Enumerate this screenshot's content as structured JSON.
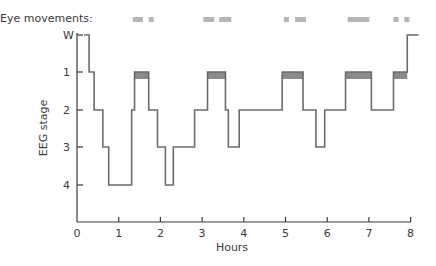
{
  "chart_data": {
    "type": "line",
    "subtype": "hypnogram (step)",
    "title": "",
    "xlabel": "Hours",
    "ylabel": "EEG stage",
    "xlim": [
      0,
      8
    ],
    "x_ticks": [
      "0",
      "1",
      "2",
      "3",
      "4",
      "5",
      "6",
      "7",
      "8"
    ],
    "y_ticks": [
      "W",
      "1",
      "2",
      "3",
      "4"
    ],
    "y_order_top_to_bottom": [
      "W",
      "1",
      "2",
      "3",
      "4"
    ],
    "grid": false,
    "legend": null,
    "eye_movements_label": "Eye movements:",
    "eye_movement_bars_hours": [
      [
        1.34,
        1.58
      ],
      [
        1.72,
        1.84
      ],
      [
        3.03,
        3.29
      ],
      [
        3.41,
        3.7
      ],
      [
        4.96,
        5.08
      ],
      [
        5.23,
        5.49
      ],
      [
        6.49,
        7.01
      ],
      [
        7.59,
        7.71
      ],
      [
        7.85,
        7.97
      ]
    ],
    "segments": [
      {
        "stage": "W",
        "start": 0.17,
        "end": 0.29,
        "rem": false
      },
      {
        "stage": "1",
        "start": 0.29,
        "end": 0.41,
        "rem": false
      },
      {
        "stage": "2",
        "start": 0.41,
        "end": 0.62,
        "rem": false
      },
      {
        "stage": "3",
        "start": 0.62,
        "end": 0.76,
        "rem": false
      },
      {
        "stage": "4",
        "start": 0.76,
        "end": 1.31,
        "rem": false
      },
      {
        "stage": "2",
        "start": 1.31,
        "end": 1.38,
        "rem": false
      },
      {
        "stage": "1",
        "start": 1.38,
        "end": 1.72,
        "rem": true
      },
      {
        "stage": "2",
        "start": 1.72,
        "end": 1.93,
        "rem": false
      },
      {
        "stage": "3",
        "start": 1.93,
        "end": 2.12,
        "rem": false
      },
      {
        "stage": "4",
        "start": 2.12,
        "end": 2.31,
        "rem": false
      },
      {
        "stage": "3",
        "start": 2.31,
        "end": 2.82,
        "rem": false
      },
      {
        "stage": "2",
        "start": 2.82,
        "end": 3.13,
        "rem": false
      },
      {
        "stage": "1",
        "start": 3.13,
        "end": 3.56,
        "rem": true
      },
      {
        "stage": "2",
        "start": 3.56,
        "end": 3.63,
        "rem": false
      },
      {
        "stage": "3",
        "start": 3.63,
        "end": 3.89,
        "rem": false
      },
      {
        "stage": "2",
        "start": 3.89,
        "end": 4.92,
        "rem": false
      },
      {
        "stage": "1",
        "start": 4.92,
        "end": 5.42,
        "rem": true
      },
      {
        "stage": "2",
        "start": 5.42,
        "end": 5.73,
        "rem": false
      },
      {
        "stage": "3",
        "start": 5.73,
        "end": 5.94,
        "rem": false
      },
      {
        "stage": "2",
        "start": 5.94,
        "end": 6.44,
        "rem": false
      },
      {
        "stage": "1",
        "start": 6.44,
        "end": 7.06,
        "rem": true
      },
      {
        "stage": "2",
        "start": 7.06,
        "end": 7.59,
        "rem": false
      },
      {
        "stage": "1",
        "start": 7.59,
        "end": 7.92,
        "rem": true
      },
      {
        "stage": "W",
        "start": 7.92,
        "end": 8.19,
        "rem": false
      }
    ],
    "colors": {
      "line": "#6b6b6b",
      "axis": "#3a3a3a",
      "rem_fill": "#8a8a8a",
      "eye_bar": "#b5b5b5"
    }
  }
}
